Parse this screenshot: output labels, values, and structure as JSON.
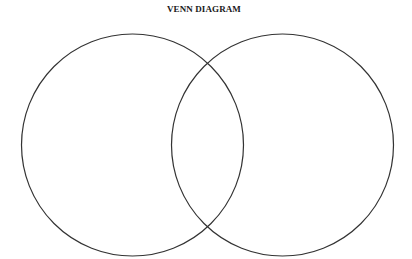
{
  "diagram": {
    "title": "VENN DIAGRAM",
    "stroke_color": "#333333",
    "fill_color": "none",
    "circles": [
      {
        "id": "left",
        "cx": 132.5,
        "cy": 145,
        "r": 111
      },
      {
        "id": "right",
        "cx": 282.5,
        "cy": 145,
        "r": 111
      }
    ]
  }
}
